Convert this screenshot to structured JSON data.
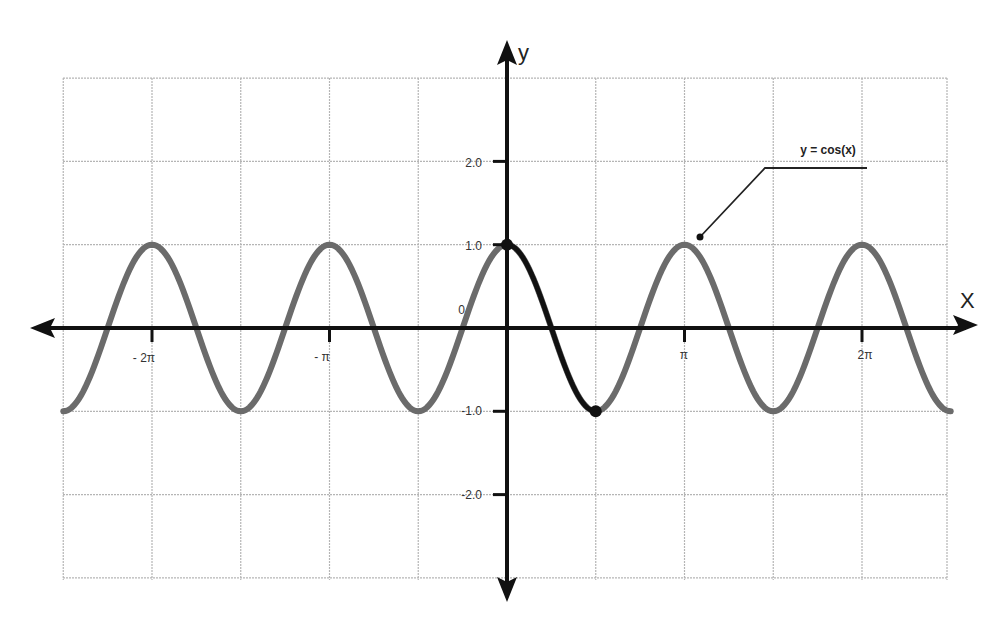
{
  "chart_data": {
    "type": "line",
    "title": "",
    "xlabel": "x",
    "ylabel": "y",
    "annotation": "y = cos(x)",
    "grid": true,
    "legend": "none",
    "xlim": [
      -2.5,
      2.5
    ],
    "ylim": [
      -3,
      3
    ],
    "x_unit": "pi",
    "x_ticks": [
      {
        "value": -2,
        "label": "- 2π"
      },
      {
        "value": -1,
        "label": "- π"
      },
      {
        "value": 1,
        "label": "π"
      },
      {
        "value": 2,
        "label": "2π"
      }
    ],
    "y_ticks": [
      {
        "value": 2,
        "label": "2.0"
      },
      {
        "value": 1,
        "label": "1.0"
      },
      {
        "value": 0,
        "label": "0"
      },
      {
        "value": -1,
        "label": "-1.0"
      },
      {
        "value": -2,
        "label": "-2.0"
      }
    ],
    "series": [
      {
        "name": "y = cos(x)",
        "color": "#6b6b6b",
        "x": [
          -2.5,
          -2.0,
          -1.5,
          -1.0,
          -0.5,
          0.0,
          0.5,
          1.0,
          1.5,
          2.0,
          2.5
        ],
        "values": [
          -1,
          1,
          -1,
          1,
          -1,
          1,
          -1,
          1,
          -1,
          1,
          -1
        ]
      },
      {
        "name": "highlighted half-period",
        "color": "#111111",
        "x": [
          0.0,
          0.5
        ],
        "values": [
          1,
          -1
        ],
        "markers": [
          {
            "x": 0.0,
            "y": 1
          },
          {
            "x": 0.5,
            "y": -1
          }
        ]
      }
    ]
  },
  "labels": {
    "y_axis": "y",
    "x_axis": "X",
    "annotation": "y = cos(x)",
    "x_ticks": [
      "- 2π",
      "- π",
      "π",
      "2π"
    ],
    "y_ticks": [
      "2.0",
      "1.0",
      "0",
      "-1.0",
      "-2.0"
    ]
  },
  "colors": {
    "grid": "#b5b5b5",
    "axis": "#111111",
    "curve": "#6b6b6b",
    "highlight": "#111111"
  }
}
